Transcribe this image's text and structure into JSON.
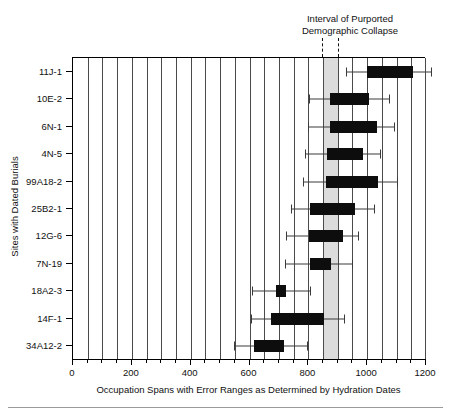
{
  "chart_data": {
    "type": "bar",
    "title": "",
    "xlabel": "Occupation Spans with Error Ranges as Determined by Hydration Dates",
    "ylabel": "Sites with Dated Burials",
    "xlim": [
      0,
      1200
    ],
    "xticks": [
      0,
      200,
      400,
      600,
      800,
      1000,
      1200
    ],
    "xticklabels": [
      "0",
      "200",
      "400",
      "600",
      "800",
      "1000",
      "1200"
    ],
    "minor_tick_step": 50,
    "grid": "vertical-major-and-minor",
    "legend": "none",
    "categories": [
      "11J-1",
      "10E-2",
      "6N-1",
      "4N-5",
      "99A18-2",
      "25B2-1",
      "12G-6",
      "7N-19",
      "18A2-3",
      "14F-1",
      "34A12-2"
    ],
    "annotations": [
      {
        "text_line_1": "Interval of Purported",
        "text_line_2": "Demographic Collapse",
        "span_start": 850,
        "span_end": 905,
        "shading_color": "#dcdcdc",
        "leader_style": "dashed"
      }
    ],
    "series": [
      {
        "name": "Occupation span (box) with error range (whiskers)",
        "box_color": "#0d0d0d",
        "whisker_color": "#3a3a3a",
        "values": [
          {
            "label": "11J-1",
            "box_start": 1000,
            "box_end": 1157,
            "err_low": 928,
            "err_high": 1218
          },
          {
            "label": "10E-2",
            "box_start": 874,
            "box_end": 1007,
            "err_low": 802,
            "err_high": 1075
          },
          {
            "label": "6N-1",
            "box_start": 874,
            "box_end": 1034,
            "err_low": 799,
            "err_high": 1092
          },
          {
            "label": "4N-5",
            "box_start": 864,
            "box_end": 986,
            "err_low": 789,
            "err_high": 1044
          },
          {
            "label": "99A18-2",
            "box_start": 860,
            "box_end": 1037,
            "err_low": 782,
            "err_high": 1102
          },
          {
            "label": "25B2-1",
            "box_start": 806,
            "box_end": 959,
            "err_low": 741,
            "err_high": 1024
          },
          {
            "label": "12G-6",
            "box_start": 803,
            "box_end": 918,
            "err_low": 724,
            "err_high": 969
          },
          {
            "label": "7N-19",
            "box_start": 806,
            "box_end": 877,
            "err_low": 721,
            "err_high": 949
          },
          {
            "label": "18A2-3",
            "box_start": 690,
            "box_end": 724,
            "err_low": 608,
            "err_high": 806
          },
          {
            "label": "14F-1",
            "box_start": 673,
            "box_end": 854,
            "err_low": 605,
            "err_high": 921
          },
          {
            "label": "34A12-2",
            "box_start": 616,
            "box_end": 718,
            "err_low": 548,
            "err_high": 797
          }
        ]
      }
    ]
  }
}
